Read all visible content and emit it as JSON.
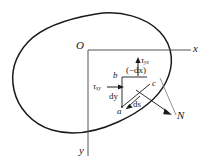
{
  "figure": {
    "type": "mechanics-stress-element-diagram",
    "background_color": "#ffffff",
    "line_color": "#1a1a1a"
  },
  "axes": {
    "origin_label": "O",
    "x_label": "x",
    "y_label": "y"
  },
  "element": {
    "vertex_a": "a",
    "vertex_b": "b",
    "vertex_c": "c",
    "side_dy": "dy",
    "side_dx": "(−dx)",
    "side_ds": "ds"
  },
  "stresses": {
    "tau_xy": "τ",
    "tau_xy_sub": "xy",
    "tau_yx": "τ",
    "tau_yx_sub": "yx"
  },
  "normal": {
    "label": "N"
  }
}
